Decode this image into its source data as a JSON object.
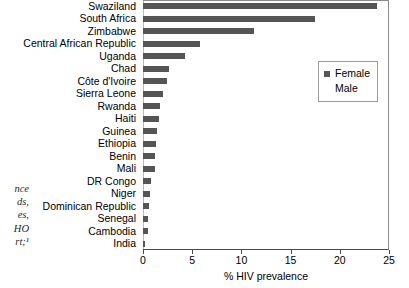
{
  "chart_data": {
    "type": "bar",
    "orientation": "horizontal",
    "title": "",
    "xlabel": "% HIV prevalence",
    "ylabel": "",
    "xlim": [
      0,
      25
    ],
    "xticks": [
      0,
      5,
      10,
      15,
      20,
      25
    ],
    "xtick_labels": [
      "0",
      "5",
      "10",
      "15",
      "20",
      "25"
    ],
    "grid": false,
    "legend_position": "upper right",
    "categories": [
      "Swaziland",
      "South Africa",
      "Zimbabwe",
      "Central African Republic",
      "Uganda",
      "Chad",
      "Côte d'Ivoire",
      "Sierra Leone",
      "Rwanda",
      "Haiti",
      "Guinea",
      "Ethiopia",
      "Benin",
      "Mali",
      "DR Congo",
      "Niger",
      "Dominican Republic",
      "Senegal",
      "Cambodia",
      "India"
    ],
    "series": [
      {
        "name": "Female",
        "color": "#555555",
        "values": [
          23.8,
          17.5,
          11.3,
          5.8,
          4.3,
          2.6,
          2.4,
          2.0,
          1.7,
          1.6,
          1.4,
          1.3,
          1.2,
          1.2,
          0.8,
          0.7,
          0.6,
          0.5,
          0.5,
          0.2
        ]
      }
    ]
  },
  "legend": {
    "entries": [
      {
        "label": "Female",
        "color": "#555555"
      },
      {
        "label": "Male",
        "color": "#ffffff"
      }
    ]
  },
  "caption_fragments": {
    "lines": [
      "nce",
      "ds,",
      "es,",
      "HO",
      "rt;¹"
    ]
  },
  "colors": {
    "bar": "#555555",
    "axis": "#4a4a4a",
    "frame": "#8a8a8a",
    "background": "#ffffff"
  }
}
